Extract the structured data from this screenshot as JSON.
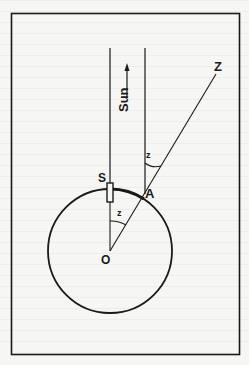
{
  "figure": {
    "type": "geometric-diagram"
  },
  "labels": {
    "sun": "Sun",
    "zenith": "Z",
    "syene": "S",
    "alexandria": "A",
    "center": "O",
    "angle_top": "z",
    "angle_center": "z"
  },
  "colors": {
    "ink": "#1a1a1a",
    "paper": "#f6f6f4"
  }
}
